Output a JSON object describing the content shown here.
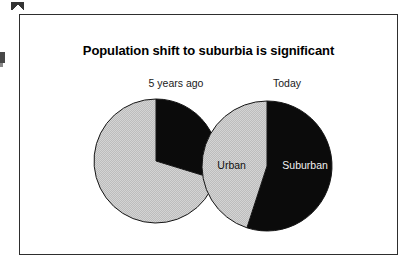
{
  "slide": {
    "title": "Population shift to suburbia is significant",
    "frame_border_color": "#2e2e2e",
    "background_color": "#ffffff"
  },
  "captions": {
    "left": "5 years ago",
    "right": "Today"
  },
  "chart_data": {
    "type": "pie",
    "title": "Population shift to suburbia is significant",
    "xlabel": "",
    "ylabel": "",
    "legend_position": "in-slice labels",
    "grid": false,
    "colors": {
      "urban": "#c8c8c8",
      "suburban": "#0b0b0b",
      "outline": "#151515"
    },
    "charts": [
      {
        "name": "5 years ago",
        "caption": "5 years ago",
        "center_px": [
          155,
          160
        ],
        "radius_px": 62,
        "labels_shown": false,
        "slices": [
          {
            "name": "Suburban",
            "label": "",
            "value": 30,
            "start_angle_deg": 0,
            "end_angle_deg": 107,
            "color": "#0b0b0b"
          },
          {
            "name": "Urban",
            "label": "",
            "value": 70,
            "start_angle_deg": 107,
            "end_angle_deg": 360,
            "color": "#c8c8c8"
          }
        ]
      },
      {
        "name": "Today",
        "caption": "Today",
        "center_px": [
          266,
          165
        ],
        "radius_px": 65,
        "labels_shown": true,
        "slices": [
          {
            "name": "Suburban",
            "label": "Suburban",
            "value": 55,
            "start_angle_deg": 0,
            "end_angle_deg": 198,
            "color": "#0b0b0b"
          },
          {
            "name": "Urban",
            "label": "Urban",
            "value": 45,
            "start_angle_deg": 198,
            "end_angle_deg": 360,
            "color": "#c8c8c8"
          }
        ]
      }
    ]
  },
  "slice_labels": {
    "suburban": "Suburban",
    "urban": "Urban"
  }
}
